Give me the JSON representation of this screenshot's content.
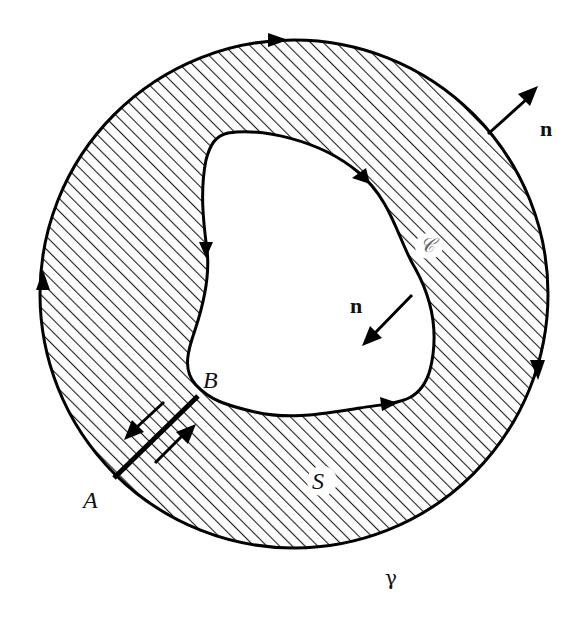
{
  "figure": {
    "colors": {
      "stroke": "#000000",
      "hatch": "#222222",
      "background": "#ffffff"
    },
    "labels": {
      "A": "A",
      "B": "B",
      "S": "S",
      "C": "𝒞",
      "gamma": "γ",
      "n_outer": "n",
      "n_inner": "n"
    },
    "curves": {
      "outer": {
        "name": "gamma",
        "orientation": "counterclockwise arrows (top rightward, left upward, right downward)"
      },
      "inner": {
        "name": "C",
        "orientation": "opposite sense (arrows down on left, right along bottom, up-left on right)"
      },
      "cut": {
        "from": "A",
        "to": "B",
        "arrows": [
          "toward A",
          "toward B"
        ]
      }
    }
  }
}
